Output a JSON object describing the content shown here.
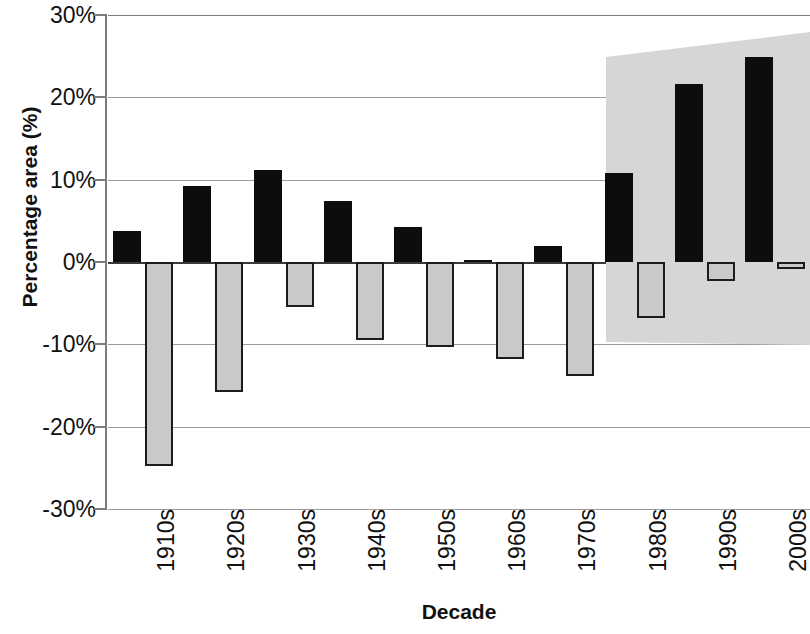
{
  "chart_data": {
    "type": "bar",
    "title": "",
    "xlabel": "Decade",
    "ylabel": "Percentage area (%)",
    "categories": [
      "1910s",
      "1920s",
      "1930s",
      "1940s",
      "1950s",
      "1960s",
      "1970s",
      "1980s",
      "1990s",
      "2000s"
    ],
    "ylim": [
      -30,
      30
    ],
    "ytick_labels": [
      "30%",
      "20%",
      "10%",
      "0%",
      "-10%",
      "-20%",
      "-30%"
    ],
    "ytick_values": [
      30,
      20,
      10,
      0,
      -10,
      -20,
      -30
    ],
    "grid": true,
    "legend": "none",
    "series": [
      {
        "name": "positive-change",
        "color": "#0d0d0d",
        "values": [
          3.8,
          9.2,
          11.2,
          7.4,
          4.2,
          0.3,
          2.0,
          10.8,
          21.6,
          24.9
        ]
      },
      {
        "name": "negative-change",
        "color": "#c9c9c9",
        "values": [
          -24.8,
          -15.8,
          -5.5,
          -9.5,
          -10.3,
          -11.8,
          -13.8,
          -6.8,
          -2.3,
          -0.8
        ]
      }
    ],
    "annotations": [
      {
        "name": "shaded-highlight-region",
        "kind": "polygon-shade",
        "color": "#d6d6d6",
        "covers": [
          "1980s",
          "1990s",
          "2000s"
        ]
      }
    ]
  }
}
